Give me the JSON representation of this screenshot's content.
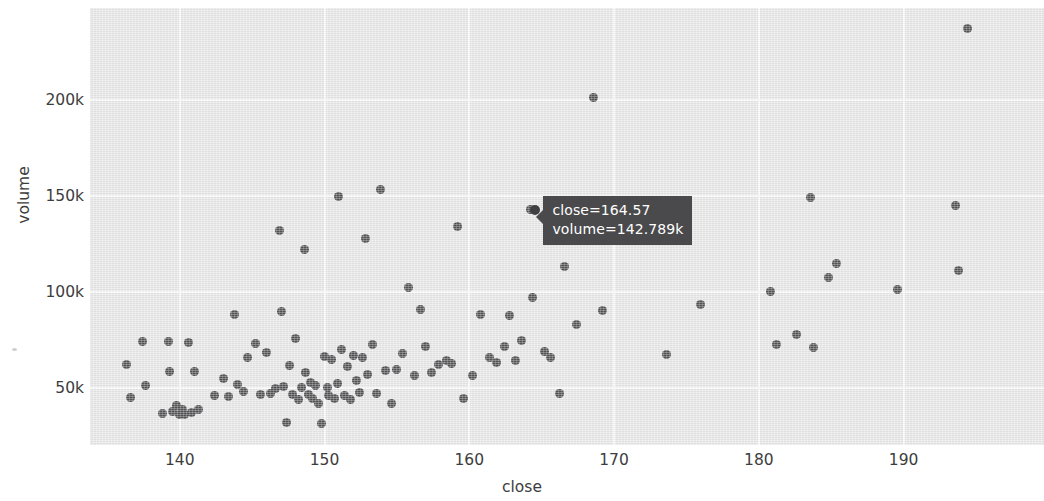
{
  "chart_data": {
    "type": "scatter",
    "title": "",
    "xlabel": "close",
    "ylabel": "volume",
    "xlim": [
      133.8,
      199.7
    ],
    "ylim": [
      20000,
      248000
    ],
    "xticks": [
      140,
      150,
      160,
      170,
      180,
      190
    ],
    "xticklabels": [
      "140",
      "150",
      "160",
      "170",
      "180",
      "190"
    ],
    "yticks": [
      50000,
      100000,
      150000,
      200000
    ],
    "yticklabels": [
      "50k",
      "100k",
      "150k",
      "200k"
    ],
    "grid": true,
    "legend": null,
    "marker_color": "#555557",
    "plot_bg_color": "#e9e9e9",
    "grid_color": "#fbfbfb",
    "points": [
      [
        136.3,
        62000
      ],
      [
        136.6,
        44800
      ],
      [
        137.4,
        74000
      ],
      [
        137.6,
        51200
      ],
      [
        138.8,
        36200
      ],
      [
        139.2,
        73800
      ],
      [
        139.3,
        58600
      ],
      [
        139.5,
        37300
      ],
      [
        139.8,
        40600
      ],
      [
        140.0,
        35800
      ],
      [
        140.2,
        38600
      ],
      [
        140.3,
        36000
      ],
      [
        140.6,
        73600
      ],
      [
        140.8,
        37200
      ],
      [
        141.0,
        58300
      ],
      [
        141.3,
        38400
      ],
      [
        142.4,
        45800
      ],
      [
        143.0,
        54600
      ],
      [
        143.4,
        45400
      ],
      [
        143.8,
        88000
      ],
      [
        144.0,
        51600
      ],
      [
        144.4,
        47700
      ],
      [
        144.7,
        65700
      ],
      [
        145.2,
        73200
      ],
      [
        145.6,
        46600
      ],
      [
        146.0,
        68300
      ],
      [
        146.3,
        46900
      ],
      [
        146.6,
        49400
      ],
      [
        146.9,
        132000
      ],
      [
        147.0,
        89400
      ],
      [
        147.2,
        50400
      ],
      [
        147.4,
        31800
      ],
      [
        147.6,
        61500
      ],
      [
        147.8,
        46200
      ],
      [
        148.0,
        75500
      ],
      [
        148.2,
        43800
      ],
      [
        148.4,
        50100
      ],
      [
        148.6,
        122000
      ],
      [
        148.7,
        57600
      ],
      [
        148.9,
        46400
      ],
      [
        149.0,
        52600
      ],
      [
        149.2,
        44300
      ],
      [
        149.4,
        50800
      ],
      [
        149.6,
        41800
      ],
      [
        149.8,
        31200
      ],
      [
        150.0,
        66000
      ],
      [
        150.2,
        50200
      ],
      [
        150.3,
        46000
      ],
      [
        150.5,
        64500
      ],
      [
        150.7,
        44200
      ],
      [
        150.9,
        52200
      ],
      [
        151.0,
        149500
      ],
      [
        151.2,
        69800
      ],
      [
        151.4,
        45900
      ],
      [
        151.6,
        61000
      ],
      [
        151.8,
        43500
      ],
      [
        152.0,
        66800
      ],
      [
        152.2,
        53600
      ],
      [
        152.4,
        47300
      ],
      [
        152.6,
        65800
      ],
      [
        152.8,
        128000
      ],
      [
        153.0,
        57000
      ],
      [
        153.3,
        72200
      ],
      [
        153.6,
        46800
      ],
      [
        153.9,
        153500
      ],
      [
        154.2,
        58900
      ],
      [
        154.6,
        41800
      ],
      [
        155.0,
        59500
      ],
      [
        155.4,
        67500
      ],
      [
        155.8,
        102000
      ],
      [
        156.2,
        56200
      ],
      [
        156.6,
        90500
      ],
      [
        157.0,
        71400
      ],
      [
        157.4,
        57800
      ],
      [
        157.9,
        61800
      ],
      [
        158.4,
        64200
      ],
      [
        158.8,
        62600
      ],
      [
        159.2,
        133800
      ],
      [
        159.6,
        44500
      ],
      [
        160.2,
        56400
      ],
      [
        160.8,
        88200
      ],
      [
        161.4,
        65900
      ],
      [
        161.9,
        63000
      ],
      [
        162.4,
        71600
      ],
      [
        162.8,
        87400
      ],
      [
        163.2,
        64200
      ],
      [
        163.6,
        74400
      ],
      [
        164.2,
        142789
      ],
      [
        164.4,
        96800
      ],
      [
        164.57,
        142789
      ],
      [
        165.2,
        69000
      ],
      [
        165.6,
        65700
      ],
      [
        166.2,
        46800
      ],
      [
        166.6,
        113000
      ],
      [
        167.4,
        82800
      ],
      [
        168.6,
        201500
      ],
      [
        169.2,
        90200
      ],
      [
        173.6,
        67400
      ],
      [
        176.0,
        93400
      ],
      [
        180.8,
        100200
      ],
      [
        181.2,
        72400
      ],
      [
        182.6,
        77800
      ],
      [
        183.6,
        149200
      ],
      [
        183.8,
        71000
      ],
      [
        184.8,
        107200
      ],
      [
        185.4,
        114600
      ],
      [
        189.6,
        101000
      ],
      [
        193.6,
        145200
      ],
      [
        193.8,
        111200
      ],
      [
        194.4,
        237500
      ]
    ],
    "annotations": [
      {
        "type": "tooltip",
        "lines": [
          "close=164.57",
          "volume=142.789k"
        ],
        "close": 164.57,
        "volume": 142789,
        "volume_label": "142.789k",
        "bg_color": "#4a4a4c",
        "text_color": "#ffffff"
      }
    ]
  },
  "axes": {
    "x": {
      "title": "close",
      "ticks": [
        {
          "label": "140",
          "value": 140
        },
        {
          "label": "150",
          "value": 150
        },
        {
          "label": "160",
          "value": 160
        },
        {
          "label": "170",
          "value": 170
        },
        {
          "label": "180",
          "value": 180
        },
        {
          "label": "190",
          "value": 190
        }
      ]
    },
    "y": {
      "title": "volume",
      "ticks": [
        {
          "label": "200k",
          "value": 200000
        },
        {
          "label": "150k",
          "value": 150000
        },
        {
          "label": "100k",
          "value": 100000
        },
        {
          "label": "50k",
          "value": 50000
        }
      ]
    }
  },
  "tooltip": {
    "line1": "close=164.57",
    "line2": "volume=142.789k"
  }
}
